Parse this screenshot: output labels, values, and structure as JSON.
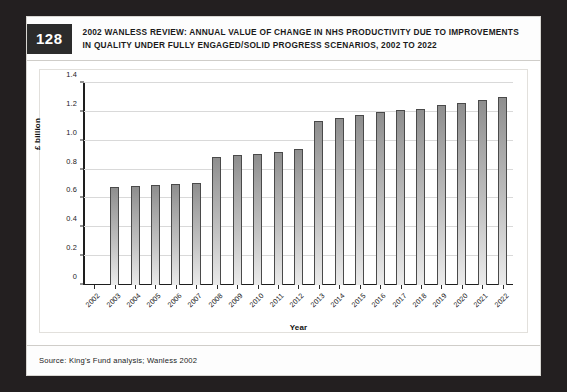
{
  "figure": {
    "number": "128",
    "title_line1": "2002 WANLESS REVIEW: ANNUAL VALUE OF CHANGE IN NHS PRODUCTIVITY DUE TO IMPROVEMENTS",
    "title_line2": "IN QUALITY UNDER FULLY ENGAGED/SOLID PROGRESS SCENARIOS, 2002 TO 2022",
    "source": "Source: King's Fund analysis; Wanless 2002"
  },
  "colors": {
    "page_background": "#231f20",
    "card_background": "#ffffff",
    "badge_background": "#2b2b2b",
    "badge_text": "#ffffff",
    "bar_fill_top": "#8e8e8e",
    "bar_fill_bottom": "#ebebeb",
    "bar_border": "#4a4a4a",
    "gridline": "#d9d9d9",
    "axis_line": "#1e1e1e"
  },
  "chart_data": {
    "type": "bar",
    "title": "2002 WANLESS REVIEW: ANNUAL VALUE OF CHANGE IN NHS PRODUCTIVITY DUE TO IMPROVEMENTS IN QUALITY UNDER FULLY ENGAGED/SOLID PROGRESS SCENARIOS, 2002 TO 2022",
    "xlabel": "Year",
    "ylabel": "£ billion",
    "ylim": [
      0,
      1.4
    ],
    "ytick_labels": [
      "0",
      "0.2",
      "0.4",
      "0.6",
      "0.8",
      "1.0",
      "1.2",
      "1.4"
    ],
    "ytick_values": [
      0,
      0.2,
      0.4,
      0.6,
      0.8,
      1.0,
      1.2,
      1.4
    ],
    "grid": true,
    "legend": "none",
    "categories": [
      "2002",
      "2003",
      "2004",
      "2005",
      "2006",
      "2007",
      "2008",
      "2009",
      "2010",
      "2011",
      "2012",
      "2013",
      "2014",
      "2015",
      "2016",
      "2017",
      "2018",
      "2019",
      "2020",
      "2021",
      "2022"
    ],
    "values": [
      0,
      0.68,
      0.685,
      0.69,
      0.7,
      0.71,
      0.89,
      0.9,
      0.91,
      0.925,
      0.94,
      1.14,
      1.16,
      1.175,
      1.2,
      1.21,
      1.22,
      1.25,
      1.26,
      1.28,
      1.3
    ]
  }
}
